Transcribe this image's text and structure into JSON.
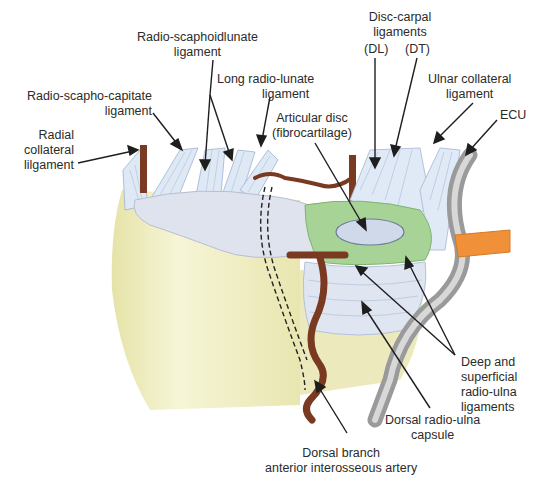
{
  "diagram": {
    "title": "",
    "labels": {
      "radio_scaphoidlunate": [
        "Radio-scaphoidlunate",
        "ligament"
      ],
      "long_radio_lunate": [
        "Long radio-lunate",
        "ligament"
      ],
      "radio_scapho_capitate": [
        "Radio-scapho-capitate",
        "ligament"
      ],
      "radial_collateral": [
        "Radial",
        "collateral",
        "lilgament"
      ],
      "articular_disc": [
        "Articular disc",
        "(fibrocartilage)"
      ],
      "disc_carpal": [
        "Disc-carpal",
        "ligaments"
      ],
      "disc_carpal_dl": "(DL)",
      "disc_carpal_dt": "(DT)",
      "ulnar_collateral": [
        "Ulnar collateral",
        "ligament"
      ],
      "ecu": "ECU",
      "deep_superficial": [
        "Deep and",
        "superficial",
        "radio-ulna",
        "ligaments"
      ],
      "dorsal_capsule": [
        "Dorsal radio-ulna",
        "capsule"
      ],
      "dorsal_branch": [
        "Dorsal branch",
        "anterior interosseous artery"
      ]
    },
    "colors": {
      "bone": "#efeec0",
      "ligament": "#dde6f3",
      "ligament_stroke": "#9fb2cf",
      "disc_green": "#9fcf8f",
      "artery": "#7a3a22",
      "ecu_tendon": "#a9a9a9",
      "retinaculum": "#f0913a",
      "arrow": "#1e1e1e"
    }
  }
}
